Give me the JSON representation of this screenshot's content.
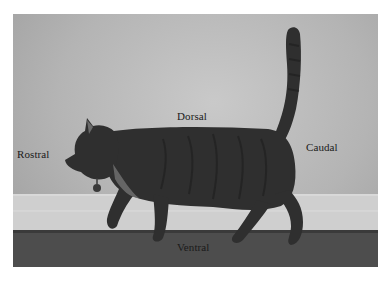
{
  "figure": {
    "labels": {
      "rostral": "Rostral",
      "dorsal": "Dorsal",
      "caudal": "Caudal",
      "ventral": "Ventral"
    },
    "colors": {
      "wall": "#b8b8b8",
      "baseboard": "#d2d2d2",
      "floor": "#4a4a4a",
      "cat": "#2e2e2e",
      "label_text": "#1a1a1a",
      "page_background": "#ffffff"
    }
  }
}
